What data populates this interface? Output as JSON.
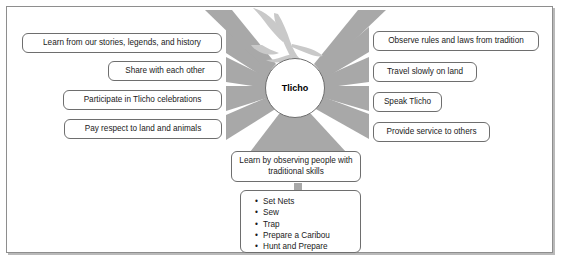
{
  "diagram": {
    "center": {
      "label": "Tlicho",
      "shape": "circle",
      "cx": 295,
      "cy": 88,
      "r": 30
    },
    "decoration": {
      "name": "bird-silhouette",
      "color": "#c9c9c9"
    },
    "colors": {
      "ray": "#a8a8a8",
      "ray_light": "#c9c9c9",
      "box_border": "#6e6e6e",
      "frame_border": "#8e8e8e",
      "frame_shadow": "#b9b9b9",
      "text": "#1a1a1a",
      "background": "#ffffff"
    },
    "left_branches": [
      {
        "label": "Learn from our stories, legends, and history",
        "x": 22,
        "y": 33,
        "w": 200,
        "h": 20
      },
      {
        "label": "Share with each other",
        "x": 108,
        "y": 61,
        "w": 114,
        "h": 20
      },
      {
        "label": "Participate in Tlicho celebrations",
        "x": 63,
        "y": 90,
        "w": 159,
        "h": 20
      },
      {
        "label": "Pay respect to land and animals",
        "x": 64,
        "y": 119,
        "w": 158,
        "h": 20
      }
    ],
    "right_branches": [
      {
        "label": "Observe rules and laws from tradition",
        "x": 373,
        "y": 31,
        "w": 166,
        "h": 20
      },
      {
        "label": "Travel slowly on land",
        "x": 373,
        "y": 62,
        "w": 104,
        "h": 20
      },
      {
        "label": "Speak Tlicho",
        "x": 373,
        "y": 92,
        "w": 69,
        "h": 20
      },
      {
        "label": "Provide service to others",
        "x": 373,
        "y": 122,
        "w": 117,
        "h": 20
      }
    ],
    "bottom_branch": {
      "label": "Learn by observing people with traditional skills",
      "x": 231,
      "y": 151,
      "w": 130,
      "h": 31
    },
    "skills": {
      "items": [
        "Set Nets",
        "Sew",
        "Trap",
        "Prepare a Caribou",
        "Hunt and Prepare"
      ]
    }
  }
}
